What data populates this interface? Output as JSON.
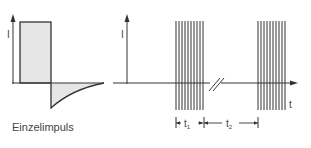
{
  "left_diagram": {
    "y_axis_label": "I",
    "caption": "Einzelimpuls",
    "colors": {
      "stroke": "#333333",
      "fill": "#e6e6e6"
    }
  },
  "right_diagram": {
    "y_axis_label": "I",
    "x_axis_label": "t",
    "bundle_count": 2,
    "lines_per_bundle": 10,
    "interval_labels": {
      "t1": {
        "base": "t",
        "sub": "1"
      },
      "t2": {
        "base": "t",
        "sub": "2"
      }
    },
    "colors": {
      "stroke": "#333333"
    }
  }
}
